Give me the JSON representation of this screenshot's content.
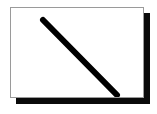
{
  "figure": {
    "title": "",
    "background_color": "#ffffff",
    "canvas": {
      "width": 157,
      "height": 114
    }
  },
  "panel": {
    "name": "white-card",
    "fill_color": "#ffffff",
    "border_color": "#9a9a9a",
    "border_width_px": 1,
    "x": 10,
    "y": 7,
    "width": 134,
    "height": 91
  },
  "shadow": {
    "name": "drop-shadow",
    "color": "#0a0a0a",
    "offset_x": 6,
    "offset_y": 6
  },
  "chart_data": {
    "type": "line",
    "title": "",
    "subtitle": "",
    "xlabel": "",
    "ylabel": "",
    "grid": false,
    "legend": null,
    "xlim": [
      0,
      134
    ],
    "ylim": [
      0,
      91
    ],
    "series": [
      {
        "name": "diagonal-stroke",
        "color": "#000000",
        "line_width_px": 6,
        "line_cap": "round",
        "x": [
          32,
          106
        ],
        "y": [
          12,
          87
        ],
        "points": [
          {
            "x": 32,
            "y": 12
          },
          {
            "x": 106,
            "y": 87
          }
        ]
      }
    ],
    "annotations": []
  }
}
